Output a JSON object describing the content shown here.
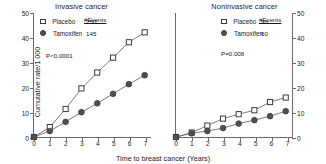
{
  "figure": {
    "axis": {
      "ylabel": "Cumulative rate/1 000",
      "xlabel": "Time to breast cancer (Years)",
      "yticks": [
        "0",
        "10",
        "20",
        "30",
        "40",
        "50"
      ],
      "xticks": [
        "0",
        "1",
        "2",
        "3",
        "4",
        "5",
        "6",
        "7"
      ]
    },
    "legend_header": "#Events",
    "colors": {
      "placebo_marker_fill": "#ffffff",
      "placebo_marker_stroke": "#3a3a3a",
      "tamoxifen_marker_fill": "#4f4f4f",
      "line": "#6b6b6b",
      "axis": "#6b6b6b",
      "text": "#1a1a1a"
    }
  },
  "panels": [
    {
      "title": "Invasive cancer",
      "pvalue": "P<0.0001",
      "legend": [
        {
          "label": "Placebo",
          "events": "250",
          "marker": "open-square"
        },
        {
          "label": "Tamoxifen",
          "events": "145",
          "marker": "filled-circle"
        }
      ]
    },
    {
      "title": "Noninvasive cancer",
      "pvalue": "P=0.008",
      "legend": [
        {
          "label": "Placebo",
          "events": "93",
          "marker": "open-square"
        },
        {
          "label": "Tamoxifen",
          "events": "60",
          "marker": "filled-circle"
        }
      ]
    }
  ],
  "chart_data": [
    {
      "type": "line",
      "title": "Invasive cancer",
      "xlabel": "Time to breast cancer (Years)",
      "ylabel": "Cumulative rate/1 000",
      "xlim": [
        0,
        7.4
      ],
      "ylim": [
        0,
        50
      ],
      "grid": false,
      "legend_position": "upper-left",
      "annotations": [
        "#Events",
        "P<0.0001"
      ],
      "x": [
        0,
        1,
        2,
        3,
        4,
        5,
        6,
        7
      ],
      "series": [
        {
          "name": "Placebo",
          "events": 250,
          "marker": "open-square",
          "values": [
            0,
            4,
            11.3,
            19.6,
            26,
            32,
            38.2,
            42.2
          ]
        },
        {
          "name": "Tamoxifen",
          "events": 145,
          "marker": "filled-circle",
          "values": [
            0,
            2.4,
            6.1,
            10,
            13.6,
            17.4,
            21.3,
            24.9
          ]
        }
      ]
    },
    {
      "type": "line",
      "title": "Noninvasive cancer",
      "xlabel": "Time to breast cancer (Years)",
      "ylabel": "Cumulative rate/1 000",
      "xlim": [
        0,
        7.4
      ],
      "ylim": [
        0,
        50
      ],
      "grid": false,
      "legend_position": "upper-left",
      "annotations": [
        "#Events",
        "P=0.008"
      ],
      "x": [
        0,
        1,
        2,
        3,
        4,
        5,
        6,
        7
      ],
      "series": [
        {
          "name": "Placebo",
          "events": 93,
          "marker": "open-square",
          "values": [
            0,
            1.8,
            4.6,
            7.4,
            9.2,
            10.8,
            14.1,
            15.9
          ]
        },
        {
          "name": "Tamoxifen",
          "events": 60,
          "marker": "filled-circle",
          "values": [
            0,
            1.5,
            2.4,
            3.6,
            5.4,
            6.8,
            8.4,
            10.4
          ]
        }
      ]
    }
  ]
}
